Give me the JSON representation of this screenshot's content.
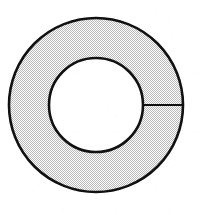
{
  "figure": {
    "shape_type": "annulus",
    "canvas": {
      "width": 207,
      "height": 215
    },
    "background_color": "#ffffff",
    "stroke_color": "#111111",
    "fill_color": "#d8d8d8",
    "hole_fill_color": "#ffffff",
    "fill_style": "stippled-dither",
    "outer_circle": {
      "name": "outer-circle",
      "center_x": 96,
      "center_y": 105,
      "radius": 87,
      "stroke_width": 2.6
    },
    "inner_circle": {
      "name": "inner-circle",
      "center_x": 96,
      "center_y": 105,
      "radius": 47,
      "stroke_width": 2.6
    },
    "radial_line": {
      "name": "radial-line",
      "angle_degrees": 0,
      "x1": 143,
      "y1": 105,
      "x2": 183,
      "y2": 105,
      "stroke_width": 2.2
    }
  }
}
